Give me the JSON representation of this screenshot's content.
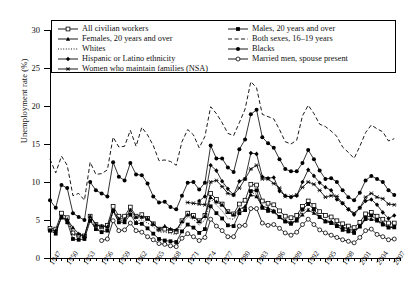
{
  "axes": {
    "ylabel": "Unemployment rate (%)",
    "yticks": [
      0,
      5,
      10,
      15,
      20,
      25,
      30
    ],
    "xticklabels": [
      "1947",
      "1950",
      "1953",
      "1956",
      "1959",
      "1962",
      "1965",
      "1968",
      "1971",
      "1974",
      "1977",
      "1980",
      "1983",
      "1986",
      "1989",
      "1992",
      "1995",
      "1998",
      "2001",
      "2004",
      "2007"
    ]
  },
  "legend": {
    "items": [
      {
        "label": "All civilian workers",
        "symbol": "line-open-square",
        "col": 0,
        "row": 0
      },
      {
        "label": "Females, 20 years and over",
        "symbol": "line-filled-triangle",
        "col": 0,
        "row": 1
      },
      {
        "label": "Whites",
        "symbol": "dotted-line",
        "col": 0,
        "row": 2
      },
      {
        "label": "Hispanic or Latino ethnicity",
        "symbol": "line-filled-diamond",
        "col": 0,
        "row": 3
      },
      {
        "label": "Women who maintain families (NSA)",
        "symbol": "line-asterisk",
        "col": 0,
        "row": 4
      },
      {
        "label": "Males, 20 years and over",
        "symbol": "line-filled-square",
        "col": 1,
        "row": 0
      },
      {
        "label": "Both sexes, 16–19 years",
        "symbol": "dashed-line",
        "col": 1,
        "row": 1
      },
      {
        "label": "Blacks",
        "symbol": "line-filled-circle",
        "col": 1,
        "row": 2
      },
      {
        "label": "Married men, spouse present",
        "symbol": "line-open-circle",
        "col": 1,
        "row": 3
      }
    ]
  },
  "chart_data": {
    "type": "line",
    "title": "",
    "xlabel": "",
    "ylabel": "Unemployment rate (%)",
    "xlim": [
      1947,
      2008
    ],
    "ylim": [
      0,
      30
    ],
    "grid": false,
    "legend_position": "top-inside",
    "x": [
      1947,
      1948,
      1949,
      1950,
      1951,
      1952,
      1953,
      1954,
      1955,
      1956,
      1957,
      1958,
      1959,
      1960,
      1961,
      1962,
      1963,
      1964,
      1965,
      1966,
      1967,
      1968,
      1969,
      1970,
      1971,
      1972,
      1973,
      1974,
      1975,
      1976,
      1977,
      1978,
      1979,
      1980,
      1981,
      1982,
      1983,
      1984,
      1985,
      1986,
      1987,
      1988,
      1989,
      1990,
      1991,
      1992,
      1993,
      1994,
      1995,
      1996,
      1997,
      1998,
      1999,
      2000,
      2001,
      2002,
      2003,
      2004,
      2005,
      2006,
      2007
    ],
    "series": [
      {
        "name": "All civilian workers",
        "marker": "open-square",
        "linestyle": "solid",
        "values": [
          3.9,
          3.8,
          5.9,
          5.3,
          3.3,
          3.0,
          2.9,
          5.5,
          4.4,
          4.1,
          4.3,
          6.8,
          5.5,
          5.5,
          6.7,
          5.5,
          5.7,
          5.2,
          4.5,
          3.8,
          3.8,
          3.6,
          3.5,
          4.9,
          5.9,
          5.6,
          4.9,
          5.6,
          8.5,
          7.7,
          7.1,
          6.1,
          5.8,
          7.1,
          7.6,
          9.7,
          9.6,
          7.5,
          7.2,
          7.0,
          6.2,
          5.5,
          5.3,
          5.6,
          6.8,
          7.5,
          6.9,
          6.1,
          5.6,
          5.4,
          4.9,
          4.5,
          4.2,
          4.0,
          4.7,
          5.8,
          6.0,
          5.5,
          5.1,
          4.6,
          4.6
        ]
      },
      {
        "name": "Males, 20 years and over",
        "marker": "filled-square",
        "linestyle": "solid",
        "values": [
          3.6,
          3.2,
          5.4,
          4.7,
          2.5,
          2.4,
          2.5,
          4.9,
          3.8,
          3.4,
          3.6,
          6.2,
          4.7,
          4.7,
          5.7,
          4.6,
          4.5,
          3.9,
          3.2,
          2.5,
          2.3,
          2.2,
          2.1,
          3.5,
          4.4,
          4.0,
          3.3,
          3.8,
          6.8,
          5.9,
          5.2,
          4.3,
          4.2,
          5.9,
          6.3,
          8.8,
          8.9,
          6.6,
          6.2,
          6.1,
          5.4,
          4.8,
          4.5,
          5.0,
          6.4,
          7.1,
          6.4,
          5.4,
          4.8,
          4.6,
          4.2,
          3.7,
          3.5,
          3.3,
          4.2,
          5.3,
          5.6,
          5.0,
          4.4,
          4.0,
          4.1
        ]
      },
      {
        "name": "Females, 20 years and over",
        "marker": "filled-triangle",
        "linestyle": "solid",
        "values": [
          3.7,
          3.6,
          5.3,
          5.1,
          4.0,
          3.2,
          2.9,
          5.5,
          4.4,
          4.2,
          4.1,
          6.2,
          5.2,
          5.1,
          6.3,
          5.4,
          5.4,
          5.2,
          4.5,
          3.8,
          4.2,
          3.8,
          3.7,
          4.8,
          5.7,
          5.4,
          4.8,
          5.5,
          8.0,
          7.4,
          7.0,
          6.0,
          5.7,
          6.4,
          6.8,
          8.3,
          8.1,
          6.8,
          6.6,
          6.2,
          5.4,
          4.9,
          4.7,
          4.9,
          5.7,
          6.3,
          5.9,
          5.4,
          4.9,
          4.8,
          4.4,
          4.1,
          3.8,
          3.6,
          4.1,
          5.1,
          5.1,
          4.9,
          4.6,
          4.1,
          4.0
        ]
      },
      {
        "name": "Both sexes, 16–19 years",
        "marker": "none",
        "linestyle": "dashed",
        "values": [
          13.0,
          11.2,
          13.4,
          12.2,
          8.2,
          8.5,
          7.6,
          12.6,
          11.0,
          11.1,
          11.6,
          15.9,
          14.6,
          14.7,
          16.8,
          14.7,
          17.2,
          16.2,
          14.8,
          12.8,
          12.9,
          12.7,
          12.2,
          15.3,
          16.9,
          16.2,
          14.5,
          16.0,
          19.9,
          19.0,
          17.8,
          16.4,
          16.1,
          17.8,
          19.6,
          23.2,
          22.4,
          18.9,
          18.6,
          18.3,
          16.9,
          15.3,
          15.0,
          15.5,
          18.7,
          20.1,
          19.0,
          17.6,
          17.3,
          16.7,
          16.0,
          14.6,
          13.9,
          13.1,
          14.7,
          16.5,
          17.5,
          17.0,
          16.6,
          15.4,
          15.7
        ]
      },
      {
        "name": "Whites",
        "marker": "none",
        "linestyle": "dotted",
        "values": [
          3.6,
          3.5,
          5.6,
          4.9,
          3.1,
          2.8,
          2.7,
          5.0,
          3.9,
          3.6,
          3.8,
          6.1,
          4.8,
          5.0,
          6.0,
          4.9,
          5.0,
          4.6,
          4.1,
          3.4,
          3.4,
          3.2,
          3.1,
          4.5,
          5.4,
          5.1,
          4.3,
          5.0,
          7.8,
          7.0,
          6.2,
          5.2,
          5.1,
          6.3,
          6.7,
          8.6,
          8.4,
          6.5,
          6.2,
          6.0,
          5.3,
          4.7,
          4.5,
          4.8,
          6.1,
          6.6,
          6.1,
          5.3,
          4.9,
          4.7,
          4.2,
          3.9,
          3.7,
          3.5,
          4.2,
          5.1,
          5.2,
          4.8,
          4.4,
          4.0,
          4.1
        ]
      },
      {
        "name": "Blacks",
        "marker": "filled-circle",
        "linestyle": "solid",
        "values": [
          7.6,
          6.6,
          9.6,
          9.2,
          5.9,
          5.4,
          5.0,
          10.0,
          8.9,
          8.5,
          8.1,
          12.6,
          10.7,
          10.2,
          12.5,
          11.0,
          10.9,
          9.8,
          8.1,
          7.3,
          7.4,
          6.7,
          6.4,
          8.2,
          9.9,
          10.0,
          9.0,
          9.9,
          14.8,
          13.1,
          13.1,
          11.9,
          11.3,
          14.3,
          15.6,
          18.9,
          19.5,
          15.9,
          15.1,
          14.5,
          13.0,
          11.7,
          11.4,
          11.4,
          12.5,
          14.2,
          13.0,
          11.5,
          10.4,
          10.5,
          10.0,
          8.9,
          8.0,
          7.6,
          8.6,
          10.2,
          10.8,
          10.4,
          10.0,
          8.9,
          8.3
        ]
      },
      {
        "name": "Hispanic or Latino ethnicity",
        "marker": "filled-diamond",
        "linestyle": "solid",
        "values": [
          null,
          null,
          null,
          null,
          null,
          null,
          null,
          null,
          null,
          null,
          null,
          null,
          null,
          null,
          null,
          null,
          null,
          null,
          null,
          null,
          null,
          null,
          null,
          null,
          null,
          null,
          7.5,
          8.1,
          12.2,
          11.5,
          10.1,
          9.1,
          8.3,
          10.1,
          10.4,
          13.8,
          13.7,
          10.7,
          10.5,
          10.6,
          8.8,
          8.2,
          8.0,
          8.2,
          10.0,
          11.6,
          10.8,
          9.9,
          9.3,
          8.9,
          7.7,
          7.2,
          6.4,
          5.7,
          6.6,
          7.5,
          7.7,
          7.0,
          6.0,
          5.2,
          5.6
        ]
      },
      {
        "name": "Married men, spouse present",
        "marker": "open-circle",
        "linestyle": "solid",
        "values": [
          null,
          null,
          null,
          null,
          null,
          null,
          null,
          null,
          null,
          2.3,
          2.5,
          4.9,
          3.6,
          3.7,
          4.6,
          3.6,
          3.4,
          2.8,
          2.4,
          1.9,
          1.8,
          1.6,
          1.5,
          2.6,
          3.2,
          2.8,
          2.3,
          2.7,
          5.1,
          4.2,
          3.6,
          2.8,
          2.8,
          4.2,
          4.3,
          6.5,
          6.5,
          4.6,
          4.3,
          4.4,
          3.9,
          3.3,
          3.0,
          3.4,
          4.4,
          5.1,
          4.4,
          3.7,
          3.3,
          3.0,
          2.7,
          2.4,
          2.2,
          2.0,
          2.7,
          3.6,
          3.8,
          3.1,
          2.8,
          2.4,
          2.5
        ]
      },
      {
        "name": "Women who maintain families (NSA)",
        "marker": "asterisk",
        "linestyle": "solid",
        "values": [
          null,
          null,
          null,
          null,
          null,
          null,
          null,
          null,
          null,
          null,
          null,
          null,
          null,
          null,
          null,
          null,
          null,
          null,
          null,
          null,
          null,
          null,
          null,
          null,
          7.3,
          7.2,
          7.1,
          7.0,
          10.0,
          10.2,
          9.4,
          8.5,
          8.3,
          9.2,
          10.4,
          11.7,
          12.2,
          10.4,
          10.4,
          9.8,
          9.2,
          8.1,
          8.1,
          8.3,
          9.3,
          10.0,
          9.7,
          8.9,
          8.0,
          8.2,
          8.1,
          7.2,
          6.4,
          5.9,
          6.6,
          8.0,
          8.5,
          8.0,
          7.8,
          7.1,
          7.0
        ]
      }
    ]
  }
}
